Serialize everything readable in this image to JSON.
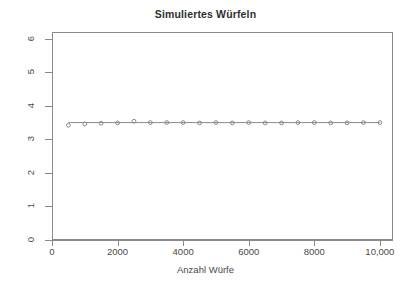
{
  "chart_data": {
    "type": "line",
    "title": "Simuliertes Würfeln",
    "xlabel": "Anzahl Würfe",
    "ylabel": "",
    "xlim": [
      0,
      10400
    ],
    "ylim": [
      0,
      6.2
    ],
    "grid": false,
    "legend": null,
    "xticks": [
      0,
      2000,
      4000,
      6000,
      8000,
      10000
    ],
    "xticklabels": [
      "0",
      "2000",
      "4000",
      "6000",
      "8000",
      "10,000"
    ],
    "yticks": [
      0,
      1,
      2,
      3,
      4,
      5,
      6
    ],
    "yticklabels": [
      "0",
      "1",
      "2",
      "3",
      "4",
      "5",
      "6"
    ],
    "marker": "open-circle",
    "marker_color": "#8a8a8a",
    "line_color": "#8a8a8a",
    "reference_line": 3.5,
    "series": [
      {
        "name": "Laufender Mittelwert",
        "x": [
          500,
          1000,
          1500,
          2000,
          2500,
          3000,
          3500,
          4000,
          4500,
          5000,
          5500,
          6000,
          6500,
          7000,
          7500,
          8000,
          8500,
          9000,
          9500,
          10000
        ],
        "values": [
          3.42,
          3.46,
          3.48,
          3.49,
          3.54,
          3.5,
          3.5,
          3.5,
          3.49,
          3.5,
          3.49,
          3.5,
          3.49,
          3.49,
          3.5,
          3.5,
          3.49,
          3.49,
          3.5,
          3.5
        ]
      }
    ]
  },
  "title": {
    "text": "Simuliertes Würfeln"
  },
  "axes": {
    "x_label": "Anzahl Würfe",
    "y_label": ""
  }
}
